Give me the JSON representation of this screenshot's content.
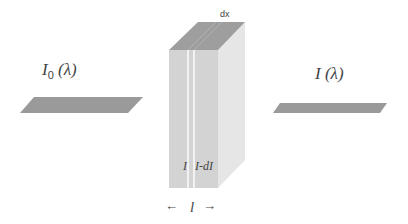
{
  "diagram": {
    "labels": {
      "incident": {
        "main": "I",
        "sub": "0",
        "arg": " (λ)"
      },
      "transmitted": {
        "main": "I",
        "arg": " (λ)"
      },
      "slice_thickness": "dx",
      "slice_in": "I",
      "slice_out": "I-dI",
      "path_length": "l",
      "arrow_left": "←",
      "arrow_right": "→"
    },
    "colors": {
      "beam": "#9a9a9a",
      "block_front": "#d3d3d3",
      "block_top": "#9e9e9e",
      "block_side": "#e6e6e6",
      "slice_line": "#f2f2f2",
      "text": "#444444"
    }
  }
}
